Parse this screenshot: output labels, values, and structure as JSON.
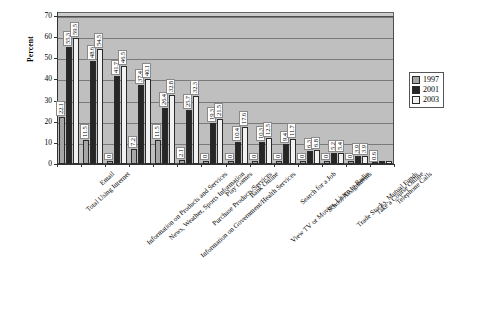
{
  "chart_data": {
    "type": "bar",
    "title": "",
    "xlabel": "",
    "ylabel": "Percent",
    "ylim": [
      0,
      70
    ],
    "yticks": [
      0,
      10,
      20,
      30,
      40,
      50,
      60,
      70
    ],
    "grid": true,
    "legend_position": "right",
    "categories": [
      "Total Using Internet",
      "Email",
      "Information on Products and Services",
      "News, Weather, Sports Information",
      "Information on Government/Health Services",
      "Purchase Products/Services",
      "Play Games",
      "Bank Online",
      "View TV or Movies, Listen to Radio",
      "Search for a Job",
      "School Assignments",
      "Trade Stocks, Mutual Funds",
      "Take a Course Online",
      "Telephone Calls"
    ],
    "series": [
      {
        "name": "1997",
        "color": "#a6a6a6",
        "values": [
          22.1,
          11.5,
          0,
          7.2,
          11.5,
          2.1,
          0,
          0,
          0,
          0,
          0,
          0,
          0,
          0.6
        ]
      },
      {
        "name": "2001",
        "color": "#262626",
        "values": [
          55.3,
          48.6,
          41.7,
          37.4,
          26.4,
          25.7,
          19.3,
          10.4,
          10.3,
          9.4,
          6.3,
          5.2,
          3.9,
          0
        ]
      },
      {
        "name": "2003",
        "color": "#f2f2f2",
        "values": [
          59.5,
          54.5,
          46.5,
          40.1,
          32.8,
          32.3,
          21.5,
          17.6,
          12.5,
          11.7,
          6.8,
          5.4,
          3.9,
          0
        ]
      }
    ],
    "value_labels": {
      "1997": [
        "22.1",
        "11.5",
        "0",
        "7.2",
        "11.5",
        "2.1",
        "0",
        "0",
        "0",
        "0",
        "0",
        "0",
        "0",
        "0.6"
      ],
      "2001": [
        "55.3",
        "48.6",
        "41.7",
        "37.4",
        "26.4",
        "25.7",
        "19.3",
        "10.4",
        "10.3",
        "9.4",
        "6.3",
        "5.2",
        "3.9",
        ""
      ],
      "2003": [
        "59.5",
        "54.5",
        "46.5",
        "40.1",
        "32.8",
        "32.3",
        "21.5",
        "17.6",
        "12.5",
        "11.7",
        "6.8",
        "5.4",
        "3.9",
        ""
      ]
    }
  },
  "legend": {
    "items": [
      {
        "label": "1997"
      },
      {
        "label": "2001"
      },
      {
        "label": "2003"
      }
    ]
  },
  "axis": {
    "y_title": "Percent",
    "y_ticks": [
      "70",
      "60",
      "50",
      "40",
      "30",
      "20",
      "10",
      "0"
    ]
  }
}
